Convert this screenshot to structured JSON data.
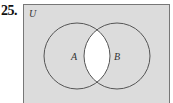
{
  "problem": {
    "number": "25."
  },
  "diagram": {
    "type": "venn",
    "universe_label": "U",
    "sets": [
      {
        "label": "A"
      },
      {
        "label": "B"
      }
    ],
    "shaded_region": "complement of A∩B",
    "unshaded_region": "A∩B",
    "colors": {
      "shade": "#dcdcdc",
      "unshaded": "#ffffff",
      "stroke": "#555555"
    }
  }
}
